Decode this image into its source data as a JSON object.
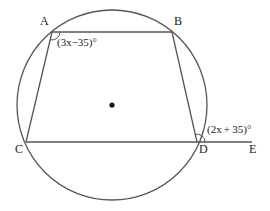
{
  "diagram": {
    "type": "circle-geometry",
    "colors": {
      "stroke": "#555555",
      "text": "#222222",
      "background": "#ffffff"
    },
    "circle": {
      "cx": 112,
      "cy": 105,
      "r": 95
    },
    "center_dot": {
      "x": 112,
      "y": 105
    },
    "points": {
      "A": {
        "label": "A",
        "x": 52,
        "y": 32
      },
      "B": {
        "label": "B",
        "x": 172,
        "y": 32
      },
      "C": {
        "label": "C",
        "x": 26,
        "y": 142
      },
      "D": {
        "label": "D",
        "x": 197,
        "y": 142
      },
      "E": {
        "label": "E",
        "x": 252,
        "y": 142
      }
    },
    "angles": {
      "A": {
        "label": "(3x−35)°",
        "vertex": "A"
      },
      "D_exterior": {
        "label": "(2x + 35)°",
        "vertex": "D"
      }
    }
  }
}
